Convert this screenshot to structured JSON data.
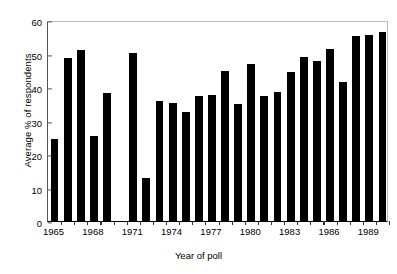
{
  "chart_data": {
    "type": "bar",
    "title": "",
    "xlabel": "Year of poll",
    "ylabel": "Average % of respondents",
    "ylim": [
      0,
      60
    ],
    "ytick_values": [
      0,
      10,
      20,
      30,
      40,
      50,
      60
    ],
    "ytick_labels": [
      "0",
      "10",
      "20",
      "30",
      "40",
      "50",
      "60"
    ],
    "xtick_labels": [
      "1965",
      "1968",
      "1971",
      "1974",
      "1977",
      "1980",
      "1983",
      "1986",
      "1989"
    ],
    "xtick_values": [
      1965,
      1968,
      1971,
      1974,
      1977,
      1980,
      1983,
      1986,
      1989
    ],
    "grid": false,
    "legend": false,
    "bar_color": "#000000",
    "categories": [
      1965,
      1966,
      1967,
      1968,
      1969,
      1970,
      1971,
      1972,
      1973,
      1974,
      1975,
      1976,
      1977,
      1978,
      1979,
      1980,
      1981,
      1982,
      1983,
      1984,
      1985,
      1986,
      1987,
      1988,
      1989,
      1990
    ],
    "values": [
      24.6,
      48.7,
      51.1,
      25.5,
      38.3,
      null,
      50.1,
      12.7,
      35.8,
      35.2,
      32.4,
      37.3,
      37.6,
      44.8,
      34.9,
      46.8,
      37.3,
      38.6,
      44.6,
      49.1,
      47.8,
      51.3,
      41.5,
      55.3,
      55.5,
      56.4
    ],
    "note": "No data bars plotted at 1970; axis gap between 1969 and 1971 region"
  },
  "axes": {
    "x_title": "Year of poll",
    "y_title": "Average % of respondents"
  }
}
